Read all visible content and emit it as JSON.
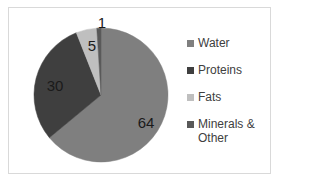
{
  "chart_data": {
    "type": "pie",
    "title": "",
    "categories": [
      "Water",
      "Proteins",
      "Fats",
      "Minerals & Other"
    ],
    "values": [
      64,
      30,
      5,
      1
    ],
    "colors": [
      "#7f7f7f",
      "#3f3f3f",
      "#bfbfbf",
      "#595959"
    ],
    "data_labels": [
      "64",
      "30",
      "5",
      "1"
    ],
    "start_angle": "12 o'clock, clockwise",
    "legend_position": "right"
  },
  "legend": {
    "items": [
      {
        "label": "Water",
        "color": "#7f7f7f"
      },
      {
        "label": "Proteins",
        "color": "#3f3f3f"
      },
      {
        "label": "Fats",
        "color": "#bfbfbf"
      },
      {
        "label": "Minerals & Other",
        "color": "#595959"
      }
    ]
  }
}
